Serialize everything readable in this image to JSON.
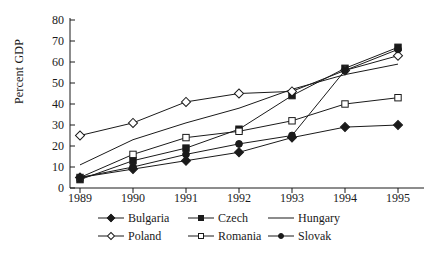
{
  "chart_data": {
    "type": "line",
    "title": "",
    "xlabel": "",
    "ylabel": "Percent GDP",
    "categories": [
      "1989",
      "1990",
      "1991",
      "1992",
      "1993",
      "1994",
      "1995"
    ],
    "x": [
      1989,
      1990,
      1991,
      1992,
      1993,
      1994,
      1995
    ],
    "xlim": [
      1989,
      1995
    ],
    "ylim": [
      0,
      80
    ],
    "yticks": [
      0,
      10,
      20,
      30,
      40,
      50,
      60,
      70,
      80
    ],
    "grid": false,
    "legend_position": "bottom",
    "series": [
      {
        "name": "Bulgaria",
        "marker": "filled-diamond",
        "values": [
          5,
          9,
          13,
          17,
          24,
          29,
          30
        ]
      },
      {
        "name": "Czech",
        "marker": "filled-square",
        "values": [
          4,
          13,
          19,
          28,
          44,
          57,
          67
        ]
      },
      {
        "name": "Hungary",
        "marker": "none",
        "values": [
          11,
          23,
          31,
          38,
          47,
          54,
          59
        ]
      },
      {
        "name": "Poland",
        "marker": "open-diamond",
        "values": [
          25,
          31,
          41,
          45,
          46,
          56,
          63
        ]
      },
      {
        "name": "Romania",
        "marker": "open-square",
        "values": [
          5,
          16,
          24,
          27,
          32,
          40,
          43
        ]
      },
      {
        "name": "Slovak",
        "marker": "filled-circle",
        "values": [
          5,
          10,
          16,
          21,
          25,
          56,
          66
        ]
      }
    ]
  },
  "axis": {
    "y_label": "Percent GDP",
    "y_ticks": [
      "80",
      "70",
      "60",
      "50",
      "40",
      "30",
      "20",
      "10",
      "0"
    ],
    "x_ticks": [
      "1989",
      "1990",
      "1991",
      "1992",
      "1993",
      "1994",
      "1995"
    ]
  },
  "legend": {
    "row1": [
      {
        "label": "Bulgaria",
        "marker": "filled-diamond"
      },
      {
        "label": "Czech",
        "marker": "filled-square"
      },
      {
        "label": "Hungary",
        "marker": "none"
      }
    ],
    "row2": [
      {
        "label": "Poland",
        "marker": "open-diamond"
      },
      {
        "label": "Romania",
        "marker": "open-square"
      },
      {
        "label": "Slovak",
        "marker": "filled-circle"
      }
    ]
  },
  "colors": {
    "line": "#1a1a1a",
    "background": "#ffffff",
    "marker_fill": "#1a1a1a",
    "marker_open": "#ffffff"
  }
}
